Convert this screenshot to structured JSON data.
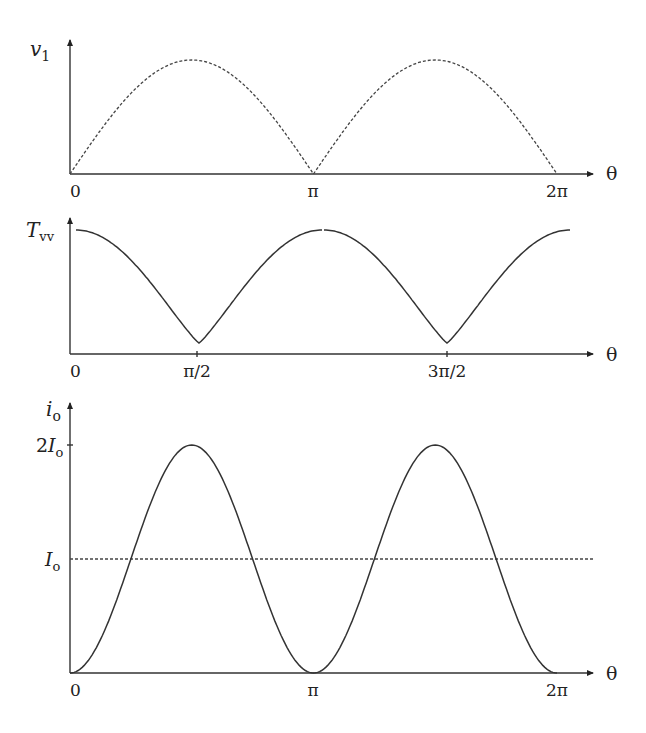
{
  "panels": [
    {
      "id": "v1",
      "ylabel_main": "v",
      "ylabel_sub": "1",
      "xlabel": "θ",
      "xticks": [
        "0",
        "π",
        "2π"
      ],
      "curve_style": "dashed",
      "description": "rectified sine |sin θ|, peaks at π/2 and 3π/2"
    },
    {
      "id": "Tvv",
      "ylabel_main": "T",
      "ylabel_sub": "vv",
      "xlabel": "θ",
      "xticks": [
        "0",
        "π/2",
        "3π/2"
      ],
      "curve_style": "solid",
      "description": "cusped curve: max at 0, π, 2π (cusps), minima at π/2 and 3π/2"
    },
    {
      "id": "io",
      "ylabel_main": "i",
      "ylabel_sub": "o",
      "xlabel": "θ",
      "xticks": [
        "0",
        "π",
        "2π"
      ],
      "yticks": [
        {
          "main": "2I",
          "sub": "o"
        },
        {
          "main": "I",
          "sub": "o"
        }
      ],
      "curve_style": "solid",
      "reference_line": {
        "label": "I_o",
        "style": "dashed"
      },
      "description": "i_o = I_o(1 - cos 2θ), peaks 2I_o at π/2 and 3π/2, zero at 0, π, 2π"
    }
  ],
  "chart_data": [
    {
      "type": "line",
      "title": "",
      "xlabel": "θ",
      "ylabel": "v1",
      "x": [
        "0",
        "π/4",
        "π/2",
        "3π/4",
        "π",
        "5π/4",
        "3π/2",
        "7π/4",
        "2π"
      ],
      "values": [
        0,
        0.707,
        1,
        0.707,
        0,
        0.707,
        1,
        0.707,
        0
      ],
      "xticks": [
        "0",
        "π",
        "2π"
      ],
      "line_style": "dashed",
      "grid": false
    },
    {
      "type": "line",
      "title": "",
      "xlabel": "θ",
      "ylabel": "Tvv",
      "x": [
        "0",
        "π/4",
        "π/2",
        "3π/4",
        "π",
        "5π/4",
        "3π/2",
        "7π/4",
        "2π"
      ],
      "values": [
        1,
        0.45,
        0.1,
        0.45,
        1,
        0.45,
        0.1,
        0.45,
        1
      ],
      "xticks": [
        "0",
        "π/2",
        "3π/2"
      ],
      "line_style": "solid",
      "grid": false
    },
    {
      "type": "line",
      "title": "",
      "xlabel": "θ",
      "ylabel": "io",
      "x": [
        "0",
        "π/4",
        "π/2",
        "3π/4",
        "π",
        "5π/4",
        "3π/2",
        "7π/4",
        "2π"
      ],
      "series": [
        {
          "name": "io",
          "values": [
            0,
            1,
            2,
            1,
            0,
            1,
            2,
            1,
            0
          ],
          "style": "solid"
        },
        {
          "name": "Io",
          "values": [
            1,
            1,
            1,
            1,
            1,
            1,
            1,
            1,
            1
          ],
          "style": "dashed"
        }
      ],
      "yticks": [
        "2Io",
        "Io"
      ],
      "xticks": [
        "0",
        "π",
        "2π"
      ],
      "units": "Io",
      "grid": false
    }
  ]
}
